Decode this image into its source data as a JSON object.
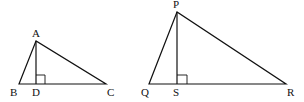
{
  "figure": {
    "triangles": [
      {
        "name": "ABC",
        "vertices": {
          "A": {
            "label": "A",
            "x": 36,
            "y": 41
          },
          "B": {
            "label": "B",
            "x": 19,
            "y": 84
          },
          "C": {
            "label": "C",
            "x": 106,
            "y": 84
          },
          "D": {
            "label": "D",
            "x": 36,
            "y": 84
          }
        },
        "altitude": "AD",
        "right_angle_at": "D"
      },
      {
        "name": "PQR",
        "vertices": {
          "P": {
            "label": "P",
            "x": 177,
            "y": 12
          },
          "Q": {
            "label": "Q",
            "x": 149,
            "y": 84
          },
          "R": {
            "label": "R",
            "x": 286,
            "y": 84
          },
          "S": {
            "label": "S",
            "x": 177,
            "y": 84
          }
        },
        "altitude": "PS",
        "right_angle_at": "S"
      }
    ],
    "colors": {
      "stroke": "#111111",
      "background": "#ffffff"
    }
  }
}
